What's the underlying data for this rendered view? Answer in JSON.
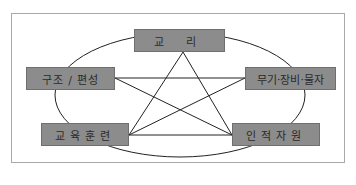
{
  "diagram": {
    "type": "pentagram-relationship",
    "nodes": {
      "top": "교 리",
      "left": "구조 / 편성",
      "right": "무기·장비·물자",
      "bottom_left": "교육훈련",
      "bottom_right": "인적자원"
    },
    "edges": [
      [
        "top",
        "bottom_left"
      ],
      [
        "top",
        "bottom_right"
      ],
      [
        "left",
        "right"
      ],
      [
        "left",
        "bottom_right"
      ],
      [
        "right",
        "bottom_left"
      ],
      [
        "bottom_left",
        "bottom_right"
      ]
    ],
    "enclosure": "ellipse connecting all five nodes",
    "colors": {
      "box_fill": "#8c8c8c",
      "box_border": "#6f6f6f",
      "line": "#222222",
      "frame_border": "#a9a9a9"
    }
  }
}
